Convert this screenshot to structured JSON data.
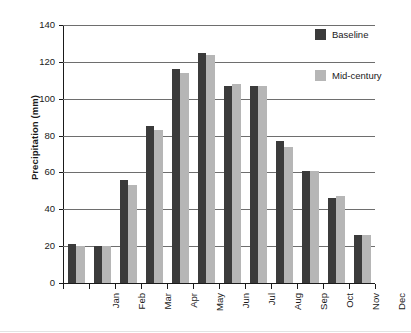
{
  "chart_data": {
    "type": "bar",
    "title": "",
    "xlabel": "",
    "ylabel": "Precipitation (mm)",
    "ylim": [
      0,
      140
    ],
    "ytick_values": [
      0,
      20,
      40,
      60,
      80,
      100,
      120,
      140
    ],
    "ytick_labels": [
      "0",
      "20",
      "40",
      "60",
      "80",
      "100",
      "120",
      "140"
    ],
    "grid": true,
    "legend_position": "upper right",
    "categories": [
      "Jan",
      "Feb",
      "Mar",
      "Apr",
      "May",
      "Jun",
      "Jul",
      "Aug",
      "Sep",
      "Oct",
      "Nov",
      "Dec"
    ],
    "series": [
      {
        "name": "Baseline",
        "color": "#3b3b3b",
        "values": [
          21,
          20,
          56,
          85,
          116,
          125,
          107,
          107,
          77,
          61,
          46,
          26
        ]
      },
      {
        "name": "Mid-century",
        "color": "#b6b6b6",
        "values": [
          20,
          20,
          53,
          83,
          114,
          124,
          108,
          107,
          74,
          61,
          47,
          26
        ]
      }
    ]
  },
  "axes": {
    "y_title": "Precipitation (mm)"
  },
  "legend": {
    "items": [
      {
        "label": "Baseline",
        "color": "#3b3b3b"
      },
      {
        "label": "Mid-century",
        "color": "#b6b6b6"
      }
    ]
  }
}
